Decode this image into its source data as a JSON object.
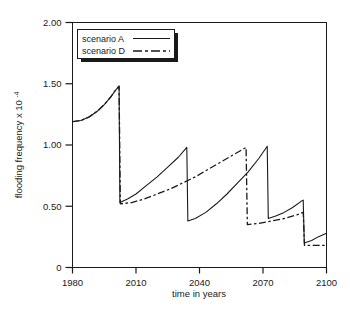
{
  "chart_data": {
    "type": "line",
    "title": "",
    "xlabel": "time in years",
    "ylabel": "flooding frequency x 10",
    "ylabel_exponent": "-4",
    "xlim": [
      1980,
      2100
    ],
    "ylim": [
      0,
      2.0
    ],
    "grid": false,
    "legend_position": "top-left",
    "xticks": [
      1980,
      2010,
      2040,
      2070,
      2100
    ],
    "xtick_labels": [
      "1980",
      "2010",
      "2040",
      "2070",
      "2100"
    ],
    "yticks": [
      0,
      0.5,
      1.0,
      1.5,
      2.0
    ],
    "ytick_labels": [
      "0",
      "0.50",
      "1.00",
      "1.50",
      "2.00"
    ],
    "series": [
      {
        "name": "scenario A",
        "style": "solid",
        "color": "#1a1a1a",
        "points": [
          [
            1980,
            1.19
          ],
          [
            1984,
            1.2
          ],
          [
            1988,
            1.23
          ],
          [
            1992,
            1.28
          ],
          [
            1995,
            1.33
          ],
          [
            1998,
            1.39
          ],
          [
            2000,
            1.44
          ],
          [
            2002,
            1.48
          ],
          [
            2002.4,
            0.53
          ],
          [
            2006,
            0.56
          ],
          [
            2010,
            0.6
          ],
          [
            2015,
            0.67
          ],
          [
            2020,
            0.74
          ],
          [
            2025,
            0.82
          ],
          [
            2030,
            0.9
          ],
          [
            2034,
            0.98
          ],
          [
            2034.5,
            0.38
          ],
          [
            2038,
            0.4
          ],
          [
            2043,
            0.45
          ],
          [
            2048,
            0.52
          ],
          [
            2053,
            0.6
          ],
          [
            2058,
            0.69
          ],
          [
            2063,
            0.78
          ],
          [
            2068,
            0.89
          ],
          [
            2072,
            0.99
          ],
          [
            2072.5,
            0.4
          ],
          [
            2076,
            0.42
          ],
          [
            2080,
            0.45
          ],
          [
            2084,
            0.49
          ],
          [
            2088,
            0.54
          ],
          [
            2089,
            0.55
          ],
          [
            2089.5,
            0.2
          ],
          [
            2093,
            0.22
          ],
          [
            2096,
            0.25
          ],
          [
            2100,
            0.28
          ]
        ]
      },
      {
        "name": "scenario D",
        "style": "dash-dot",
        "color": "#1a1a1a",
        "points": [
          [
            1980,
            1.19
          ],
          [
            1984,
            1.2
          ],
          [
            1988,
            1.23
          ],
          [
            1992,
            1.28
          ],
          [
            1995,
            1.33
          ],
          [
            1998,
            1.39
          ],
          [
            2000,
            1.44
          ],
          [
            2002,
            1.48
          ],
          [
            2002.6,
            0.52
          ],
          [
            2008,
            0.53
          ],
          [
            2014,
            0.56
          ],
          [
            2020,
            0.6
          ],
          [
            2026,
            0.64
          ],
          [
            2032,
            0.69
          ],
          [
            2038,
            0.74
          ],
          [
            2044,
            0.8
          ],
          [
            2050,
            0.86
          ],
          [
            2056,
            0.92
          ],
          [
            2062,
            0.98
          ],
          [
            2062.6,
            0.35
          ],
          [
            2068,
            0.36
          ],
          [
            2074,
            0.38
          ],
          [
            2080,
            0.4
          ],
          [
            2086,
            0.43
          ],
          [
            2089,
            0.45
          ],
          [
            2089.6,
            0.18
          ],
          [
            2094,
            0.18
          ],
          [
            2100,
            0.18
          ]
        ]
      }
    ],
    "annotations": {
      "peak_2002": 1.48,
      "start_1980": 1.19
    }
  },
  "legend": {
    "entries": [
      {
        "label": "scenario A",
        "style": "solid"
      },
      {
        "label": "scenario D",
        "style": "dash-dot"
      }
    ]
  }
}
